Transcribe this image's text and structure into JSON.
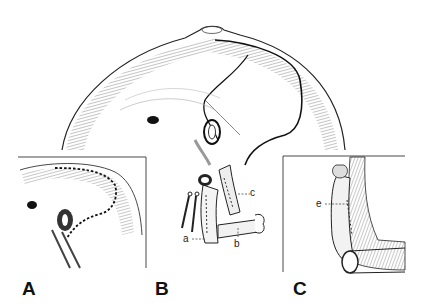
{
  "figure": {
    "panels": [
      {
        "id": "A",
        "label": "A",
        "description": "inset: liver surface with dashed incision line around hepatic vein"
      },
      {
        "id": "B",
        "label": "B",
        "description": "main view: liver lobe folded back exposing vessels with clamps"
      },
      {
        "id": "C",
        "label": "C",
        "description": "inset: sutured vessel stump joined to transverse vessel"
      }
    ],
    "callouts": [
      {
        "id": "a",
        "label": "a"
      },
      {
        "id": "b",
        "label": "b"
      },
      {
        "id": "c",
        "label": "c"
      },
      {
        "id": "e",
        "label": "e"
      }
    ],
    "colors": {
      "ink": "#1a1a1a",
      "background": "#ffffff",
      "hatch": "#555555"
    }
  }
}
